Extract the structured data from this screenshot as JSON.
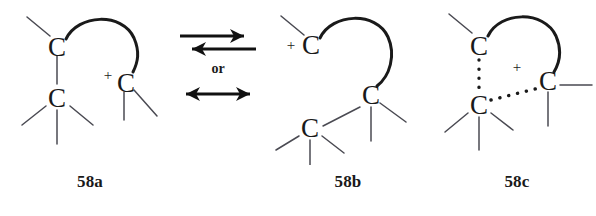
{
  "figure": {
    "type": "chemical-resonance-diagram",
    "background_color": "#ffffff",
    "ink_color": "#1a1a1a",
    "bond_color": "#4a4a52"
  },
  "structures": [
    {
      "id": "58a",
      "label": "58a",
      "atoms": [
        {
          "symbol": "C",
          "role": "bridgehead-top-left",
          "charge": ""
        },
        {
          "symbol": "C",
          "role": "lower-left",
          "charge": ""
        },
        {
          "symbol": "C",
          "role": "cationic-right",
          "charge": "+"
        }
      ],
      "bridge": "arc-from-top-left-C-to-right-C",
      "substituent_count": 6
    },
    {
      "id": "58b",
      "label": "58b",
      "atoms": [
        {
          "symbol": "C",
          "role": "cationic-top-left",
          "charge": "+"
        },
        {
          "symbol": "C",
          "role": "middle-right",
          "charge": ""
        },
        {
          "symbol": "C",
          "role": "lower-left",
          "charge": ""
        }
      ],
      "bridge": "arc-from-top-left-C-to-middle-right-C",
      "substituent_count": 6
    },
    {
      "id": "58c",
      "label": "58c",
      "atoms": [
        {
          "symbol": "C",
          "role": "top-left",
          "charge": ""
        },
        {
          "symbol": "C",
          "role": "lower-left",
          "charge": ""
        },
        {
          "symbol": "C",
          "role": "right",
          "charge": ""
        }
      ],
      "center_charge": "+",
      "bridge": "arc-from-top-left-C-to-right-C",
      "dotted_bonds": [
        "top-left-C-to-lower-left-C",
        "lower-left-C-to-right-C"
      ],
      "substituent_count": 5
    }
  ],
  "operators": {
    "equilibrium": "equilibrium-double-arrow",
    "or_label": "or",
    "resonance": "resonance-double-headed-arrow"
  }
}
